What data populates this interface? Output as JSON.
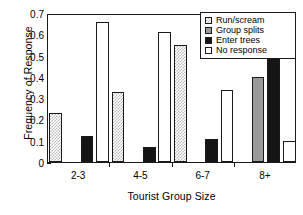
{
  "chart_data": {
    "type": "bar",
    "title": "",
    "xlabel": "Tourist Group Size",
    "ylabel": "Frequency of Response",
    "categories": [
      "2-3",
      "4-5",
      "6-7",
      "8+"
    ],
    "ylim": [
      0,
      0.7
    ],
    "yticks": [
      "0",
      "0.1",
      "0.2",
      "0.3",
      "0.4",
      "0.5",
      "0.6",
      "0.7"
    ],
    "ytick_values": [
      0,
      0.1,
      0.2,
      0.3,
      0.4,
      0.5,
      0.6,
      0.7
    ],
    "grid": false,
    "legend_position": "top-right",
    "series": [
      {
        "name": "Run/scream",
        "swatch": "sw-run",
        "color": "#c0c0c0",
        "values": [
          0.23,
          0.33,
          0.55,
          null
        ]
      },
      {
        "name": "Group splits",
        "swatch": "sw-split",
        "color": "#9a9a9a",
        "values": [
          null,
          null,
          null,
          0.4
        ]
      },
      {
        "name": "Enter trees",
        "swatch": "sw-trees",
        "color": "#151515",
        "values": [
          0.12,
          0.07,
          0.11,
          0.5
        ]
      },
      {
        "name": "No response",
        "swatch": "sw-none",
        "color": "#ffffff",
        "values": [
          0.66,
          0.61,
          0.34,
          0.1
        ]
      }
    ]
  }
}
